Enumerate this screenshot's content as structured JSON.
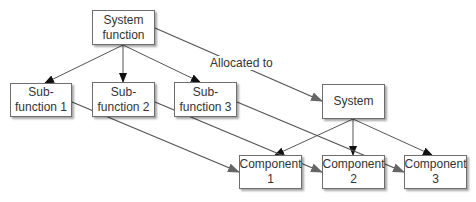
{
  "diagram": {
    "nodes": [
      {
        "id": "system-function",
        "lines": [
          "System",
          "function"
        ]
      },
      {
        "id": "sub-function-1",
        "lines": [
          "Sub-",
          "function 1"
        ]
      },
      {
        "id": "sub-function-2",
        "lines": [
          "Sub-",
          "function 2"
        ]
      },
      {
        "id": "sub-function-3",
        "lines": [
          "Sub-",
          "function 3"
        ]
      },
      {
        "id": "system",
        "lines": [
          "System"
        ]
      },
      {
        "id": "component-1",
        "lines": [
          "Component",
          "1"
        ]
      },
      {
        "id": "component-2",
        "lines": [
          "Component",
          "2"
        ]
      },
      {
        "id": "component-3",
        "lines": [
          "Component",
          "3"
        ]
      }
    ],
    "edge_label": "Allocated to",
    "edges": [
      {
        "from": "system-function",
        "to": "sub-function-1"
      },
      {
        "from": "system-function",
        "to": "sub-function-2"
      },
      {
        "from": "system-function",
        "to": "sub-function-3"
      },
      {
        "from": "system-function",
        "to": "system",
        "label": "Allocated to"
      },
      {
        "from": "system",
        "to": "component-1"
      },
      {
        "from": "system",
        "to": "component-2"
      },
      {
        "from": "system",
        "to": "component-3"
      },
      {
        "from": "sub-function-1",
        "to": "component-1"
      },
      {
        "from": "sub-function-2",
        "to": "component-2"
      },
      {
        "from": "sub-function-3",
        "to": "component-3"
      }
    ],
    "colors": {
      "line": "#555555",
      "arrow_dark": "#111111",
      "arrow_gray": "#666666",
      "box_border": "#6e6e6e"
    }
  }
}
